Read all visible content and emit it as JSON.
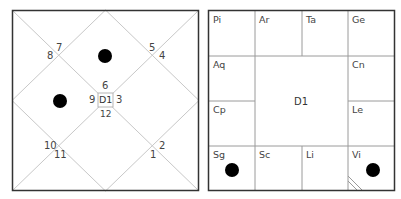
{
  "north_chart": {
    "center_label": "D1",
    "house_numbers": {
      "top": "6",
      "left": "9",
      "right": "3",
      "bottom": "12",
      "top_left_upper": "7",
      "top_left_lower": "8",
      "top_right_upper": "5",
      "top_right_lower": "4",
      "bottom_left_upper": "10",
      "bottom_left_lower": "11",
      "bottom_right_upper": "2",
      "bottom_right_lower": "1"
    },
    "planets": [
      {
        "house": "6",
        "marker": "filled-dot"
      },
      {
        "house": "9",
        "marker": "filled-dot"
      }
    ],
    "line_color": "#c8c8c8",
    "border_color": "#333333"
  },
  "south_chart": {
    "center_label": "D1",
    "signs": {
      "pi": "Pi",
      "ar": "Ar",
      "ta": "Ta",
      "ge": "Ge",
      "aq": "Aq",
      "cn": "Cn",
      "cp": "Cp",
      "le": "Le",
      "sg": "Sg",
      "sc": "Sc",
      "li": "Li",
      "vi": "Vi"
    },
    "planets": [
      {
        "sign": "Sg",
        "marker": "filled-dot"
      },
      {
        "sign": "Vi",
        "marker": "filled-dot"
      }
    ],
    "ascendant_marker_sign": "Vi",
    "line_color": "#9a9a9a",
    "border_color": "#333333"
  }
}
